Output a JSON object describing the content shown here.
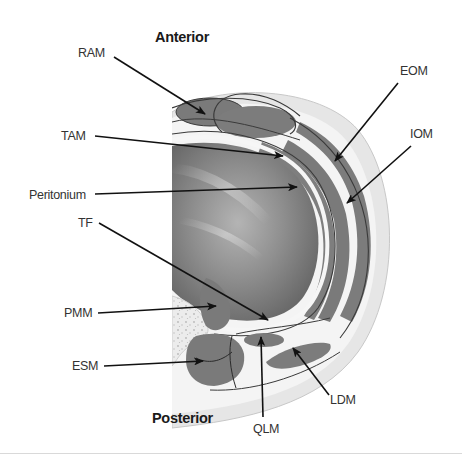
{
  "diagram": {
    "type": "anatomical cross-section (abdominal wall, transverse view)",
    "orientation": {
      "top": "Anterior",
      "bottom": "Posterior"
    },
    "labels": [
      {
        "id": "ram",
        "text": "RAM"
      },
      {
        "id": "tam",
        "text": "TAM"
      },
      {
        "id": "peritonium",
        "text": "Peritonium"
      },
      {
        "id": "tf",
        "text": "TF"
      },
      {
        "id": "pmm",
        "text": "PMM"
      },
      {
        "id": "esm",
        "text": "ESM"
      },
      {
        "id": "eom",
        "text": "EOM"
      },
      {
        "id": "iom",
        "text": "IOM"
      },
      {
        "id": "ldm",
        "text": "LDM"
      },
      {
        "id": "qlm",
        "text": "QLM"
      }
    ],
    "colors": {
      "muscle": "#7a7a7a",
      "fascia": "#f2f2f2",
      "subcutaneous": "#e4e4e4",
      "cavity_dark": "#5a5a5a",
      "cavity_light": "#a8a8a8",
      "outline": "#3a3a3a",
      "arrow": "#111111",
      "bone": "#ececec"
    }
  }
}
